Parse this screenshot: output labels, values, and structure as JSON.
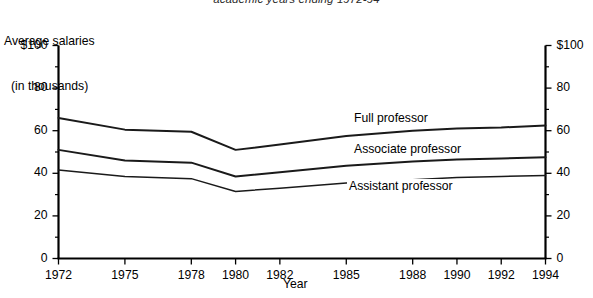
{
  "chart_data": {
    "type": "line",
    "title": "academic years ending 1972-94",
    "ylabel_line1": "Average salaries",
    "ylabel_line2": "(in thousands)",
    "xlabel": "Year",
    "grid": false,
    "legend_position": "inline-right",
    "xlim": [
      1972,
      1994
    ],
    "ylim": [
      0,
      100
    ],
    "yticks": [
      0,
      20,
      40,
      60,
      80,
      100
    ],
    "ytick_labels": [
      "0",
      "20",
      "40",
      "60",
      "80",
      "$100"
    ],
    "ytick_labels_right": [
      "0",
      "20",
      "40",
      "60",
      "80",
      "$100"
    ],
    "xticks": [
      1972,
      1975,
      1978,
      1980,
      1982,
      1985,
      1988,
      1990,
      1992,
      1994
    ],
    "xtick_labels": [
      "1972",
      "1975",
      "1978",
      "1980",
      "1982",
      "1985",
      "1988",
      "1990",
      "1992",
      "1994"
    ],
    "x": [
      1972,
      1975,
      1978,
      1980,
      1982,
      1985,
      1988,
      1990,
      1992,
      1994
    ],
    "series": [
      {
        "name": "Full professor",
        "label": "Full professor",
        "color": "#1a1a1a",
        "values": [
          66.0,
          60.5,
          59.5,
          51.0,
          53.5,
          57.5,
          60.0,
          61.0,
          61.5,
          62.5
        ]
      },
      {
        "name": "Associate professor",
        "label": "Associate professor",
        "color": "#1a1a1a",
        "values": [
          51.0,
          46.0,
          45.0,
          38.5,
          40.5,
          43.5,
          45.5,
          46.5,
          47.0,
          47.5
        ]
      },
      {
        "name": "Assistant professor",
        "label": "Assistant professor",
        "color": "#1a1a1a",
        "values": [
          41.5,
          38.5,
          37.5,
          31.5,
          33.0,
          35.5,
          37.0,
          38.0,
          38.5,
          39.0
        ]
      }
    ]
  },
  "labels": {
    "full_professor": "Full professor",
    "associate_professor": "Associate professor",
    "assistant_professor": "Assistant professor"
  }
}
